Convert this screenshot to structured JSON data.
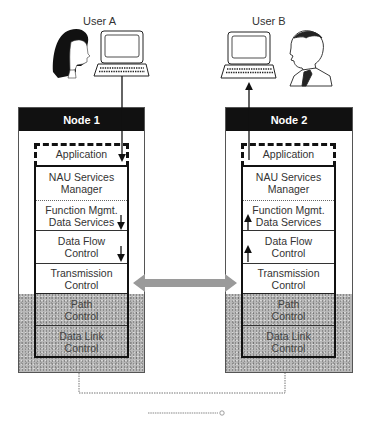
{
  "users": {
    "a": {
      "label": "User A"
    },
    "b": {
      "label": "User B"
    }
  },
  "nodes": [
    {
      "title": "Node 1",
      "layers": [
        {
          "name": "Application"
        },
        {
          "name": "NAU Services Manager"
        },
        {
          "name": "Function Mgmt. Data Services"
        },
        {
          "name": "Data Flow Control"
        },
        {
          "name": "Transmission Control"
        },
        {
          "name": "Path Control"
        },
        {
          "name": "Data Link Control"
        }
      ],
      "flow_direction": "down"
    },
    {
      "title": "Node 2",
      "layers": [
        {
          "name": "Application"
        },
        {
          "name": "NAU Services Manager"
        },
        {
          "name": "Function Mgmt. Data Services"
        },
        {
          "name": "Data Flow Control"
        },
        {
          "name": "Transmission Control"
        },
        {
          "name": "Path Control"
        },
        {
          "name": "Data Link Control"
        }
      ],
      "flow_direction": "up"
    }
  ],
  "labels": {
    "n1_app": "Application",
    "n1_nau_1": "NAU Services",
    "n1_nau_2": "Manager",
    "n1_fm_1": "Function Mgmt.",
    "n1_fm_2": "Data Services",
    "n1_df_1": "Data Flow",
    "n1_df_2": "Control",
    "n1_tc_1": "Transmission",
    "n1_tc_2": "Control",
    "n1_pc_1": "Path",
    "n1_pc_2": "Control",
    "n1_dl_1": "Data Link",
    "n1_dl_2": "Control",
    "n2_app": "Application",
    "n2_nau_1": "NAU Services",
    "n2_nau_2": "Manager",
    "n2_fm_1": "Function Mgmt.",
    "n2_fm_2": "Data Services",
    "n2_df_1": "Data Flow",
    "n2_df_2": "Control",
    "n2_tc_1": "Transmission",
    "n2_tc_2": "Control",
    "n2_pc_1": "Path",
    "n2_pc_2": "Control",
    "n2_dl_1": "Data Link",
    "n2_dl_2": "Control"
  },
  "connections": {
    "peer_link": "bidirectional arrow between Transmission Control layers",
    "physical_link": "dotted line connecting Data Link Control of Node 1 and Node 2"
  },
  "colors": {
    "header_bg": "#111111",
    "header_text": "#ffffff",
    "shaded_layers": "#b8b8b8",
    "peer_arrow": "#9a9a9a"
  }
}
